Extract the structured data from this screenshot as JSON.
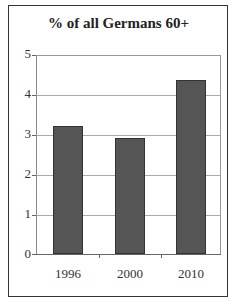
{
  "title": "% of all Germans 60+",
  "chart_data": {
    "type": "bar",
    "title": "% of all Germans 60+",
    "categories": [
      "1996",
      "2000",
      "2010"
    ],
    "values": [
      3.2,
      2.9,
      4.35
    ],
    "xlabel": "",
    "ylabel": "",
    "ylim": [
      0,
      5
    ],
    "yticks": [
      "0",
      "1",
      "2",
      "3",
      "4",
      "5"
    ],
    "grid": true,
    "legend": null,
    "bar_color": "#555555"
  }
}
